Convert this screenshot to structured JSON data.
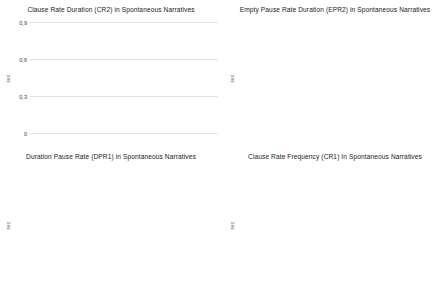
{
  "figure": {
    "layout": "2x2 grid of bar charts",
    "bar_color": "#3c3c3c",
    "gridline_color": "#e3e3e3",
    "background": "#ffffff"
  },
  "chart_data": [
    {
      "type": "bar",
      "title": "Clause Rate Duration  (CR2) in Spontaneous Narratives",
      "categories": [
        "Depressed",
        "Control"
      ],
      "values": [
        0.66,
        0.8
      ],
      "xlabel": "",
      "ylabel": "sec",
      "ylim": [
        0,
        0.9
      ],
      "yticks": [
        0,
        0.3,
        0.6,
        0.9
      ],
      "ytick_labels": [
        "0",
        "0,3",
        "0,6",
        "0,9"
      ],
      "grid": true,
      "legend": "none"
    },
    {
      "type": "bar",
      "title": "Empty Pause Rate Duration (EPR2) in Spontaneous Narratives",
      "categories": [
        "Depressed",
        "Control"
      ],
      "values": [
        0.21,
        0.11
      ],
      "xlabel": "",
      "ylabel": "sec",
      "ylim": [
        0,
        0.6
      ],
      "yticks": [
        0,
        0.3,
        0.6
      ],
      "ytick_labels": [
        "0",
        "0,3",
        "0,6"
      ],
      "grid": true,
      "legend": "none"
    },
    {
      "type": "bar",
      "title": "Duration Pause Rate  (DPR1) in Spontaneous Narratives",
      "categories": [
        "Depressed",
        "Control"
      ],
      "values": [
        0.43,
        0.23
      ],
      "xlabel": "",
      "ylabel": "sec",
      "ylim": [
        0,
        0.6
      ],
      "yticks": [
        0,
        0.3,
        0.6
      ],
      "ytick_labels": [
        "0",
        "0,3",
        "0,6"
      ],
      "grid": true,
      "legend": "none"
    },
    {
      "type": "bar",
      "title": "Clause Rate Frequency (CR1) In Spontaneous Narratives",
      "categories": [
        "Depressed",
        "Control"
      ],
      "values": [
        0.38,
        0.51
      ],
      "xlabel": "",
      "ylabel": "sec",
      "ylim": [
        0,
        0.6
      ],
      "yticks": [
        0,
        0.3,
        0.6
      ],
      "ytick_labels": [
        "0",
        "0,3",
        "0,6"
      ],
      "grid": true,
      "legend": "none"
    }
  ]
}
